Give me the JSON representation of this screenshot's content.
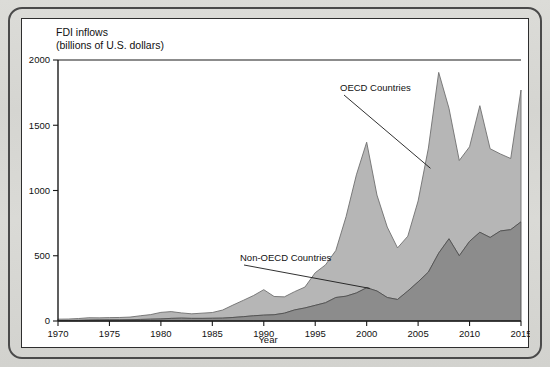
{
  "figure": {
    "title_line1": "FDI inflows",
    "title_line2": "(billions of U.S. dollars)"
  },
  "chart_data": {
    "type": "area",
    "stacked": true,
    "title": "FDI inflows (billions of U.S. dollars)",
    "xlabel": "Year",
    "ylabel": "",
    "xlim": [
      1970,
      2015
    ],
    "ylim": [
      0,
      2000
    ],
    "xticks": [
      1970,
      1975,
      1980,
      1985,
      1990,
      1995,
      2000,
      2005,
      2010,
      2015
    ],
    "yticks": [
      0,
      500,
      1000,
      1500,
      2000
    ],
    "grid": false,
    "legend_position": "inline-annotations",
    "annotations": [
      {
        "text": "OECD Countries",
        "points_to_year": 2006
      },
      {
        "text": "Non-OECD Countries",
        "points_to_year": 2000
      }
    ],
    "x": [
      1970,
      1971,
      1972,
      1973,
      1974,
      1975,
      1976,
      1977,
      1978,
      1979,
      1980,
      1981,
      1982,
      1983,
      1984,
      1985,
      1986,
      1987,
      1988,
      1989,
      1990,
      1991,
      1992,
      1993,
      1994,
      1995,
      1996,
      1997,
      1998,
      1999,
      2000,
      2001,
      2002,
      2003,
      2004,
      2005,
      2006,
      2007,
      2008,
      2009,
      2010,
      2011,
      2012,
      2013,
      2014,
      2015
    ],
    "series": [
      {
        "name": "Non-OECD Countries",
        "color": "#8c8c8c",
        "values": [
          4,
          4,
          5,
          7,
          8,
          9,
          9,
          10,
          12,
          14,
          16,
          20,
          22,
          20,
          20,
          21,
          22,
          27,
          33,
          40,
          45,
          48,
          60,
          85,
          100,
          120,
          140,
          180,
          190,
          215,
          255,
          230,
          180,
          165,
          230,
          300,
          375,
          520,
          630,
          500,
          610,
          680,
          640,
          690,
          700,
          760
        ]
      },
      {
        "name": "OECD Countries",
        "color": "#b6b6b6",
        "values": [
          10,
          11,
          14,
          18,
          16,
          17,
          18,
          20,
          28,
          35,
          50,
          52,
          40,
          35,
          40,
          44,
          62,
          95,
          125,
          155,
          195,
          140,
          125,
          140,
          160,
          250,
          290,
          360,
          610,
          905,
          1115,
          735,
          540,
          395,
          420,
          620,
          950,
          1385,
          1000,
          730,
          725,
          970,
          680,
          590,
          545,
          1010
        ]
      }
    ],
    "totals": [
      14,
      15,
      19,
      25,
      24,
      26,
      27,
      30,
      40,
      49,
      66,
      72,
      62,
      55,
      60,
      65,
      84,
      122,
      158,
      195,
      240,
      188,
      185,
      225,
      260,
      370,
      430,
      540,
      800,
      1120,
      1370,
      965,
      720,
      560,
      650,
      920,
      1325,
      1905,
      1630,
      1230,
      1335,
      1650,
      1320,
      1280,
      1245,
      1770
    ]
  },
  "axis": {
    "x_title": "Year",
    "x_tick_labels": [
      "1970",
      "1975",
      "1980",
      "1985",
      "1990",
      "1995",
      "2000",
      "2005",
      "2010",
      "2015"
    ],
    "y_tick_labels": [
      "0",
      "500",
      "1000",
      "1500",
      "2000"
    ]
  },
  "annotations": {
    "oecd_label": "OECD Countries",
    "non_oecd_label": "Non-OECD Countries"
  },
  "colors": {
    "oecd_fill": "#b6b6b6",
    "non_oecd_fill": "#8c8c8c",
    "axis": "#1a1a1a",
    "page_background": "#d9d9d5",
    "panel_background": "#ffffff"
  }
}
